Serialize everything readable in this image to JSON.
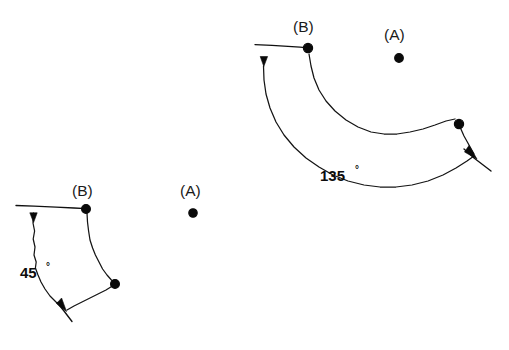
{
  "page": {
    "background_color": "#ffffff",
    "ink_color": "#101010",
    "width": 509,
    "height": 350
  },
  "figures": [
    {
      "id": "figure-45",
      "angle_label": "45",
      "degree_symbol": "°",
      "angle_label_position": {
        "x": 20,
        "y": 277
      },
      "pivot_label": "(A)",
      "pivot_label_position": {
        "x": 183,
        "y": 196
      },
      "pivot_dot_position": {
        "x": 193,
        "y": 213
      },
      "object_label": "(B)",
      "object_label_position": {
        "x": 75,
        "y": 192
      },
      "object_dot_position": {
        "x": 86,
        "y": 209
      },
      "second_vertex_position": {
        "x": 115,
        "y": 284
      },
      "reference_line": {
        "x1": 16,
        "y1": 206,
        "x2": 86,
        "y2": 209
      },
      "start_arrow_position": {
        "x": 33,
        "y": 219
      },
      "end_arrow_position": {
        "x": 65,
        "y": 309
      },
      "terminal_tick": {
        "x1": 57,
        "y1": 303,
        "x2": 73,
        "y2": 322
      }
    },
    {
      "id": "figure-135",
      "angle_label": "135",
      "degree_symbol": "°",
      "angle_label_position": {
        "x": 320,
        "y": 180
      },
      "pivot_label": "(A)",
      "pivot_label_position": {
        "x": 387,
        "y": 40
      },
      "pivot_dot_position": {
        "x": 399,
        "y": 58
      },
      "object_label": "(B)",
      "object_label_position": {
        "x": 295,
        "y": 28
      },
      "object_dot_position": {
        "x": 308,
        "y": 48
      },
      "second_vertex_position": {
        "x": 459,
        "y": 124
      },
      "reference_line": {
        "x1": 255,
        "y1": 45,
        "x2": 308,
        "y2": 48
      },
      "start_arrow_position": {
        "x": 264,
        "y": 60
      },
      "end_arrow_position": {
        "x": 476,
        "y": 158
      },
      "terminal_tick": {
        "x1": 464,
        "y1": 150,
        "x2": 492,
        "y2": 172
      }
    }
  ],
  "legend": {
    "pivot_meaning": "(A)",
    "object_meaning": "(B)"
  }
}
